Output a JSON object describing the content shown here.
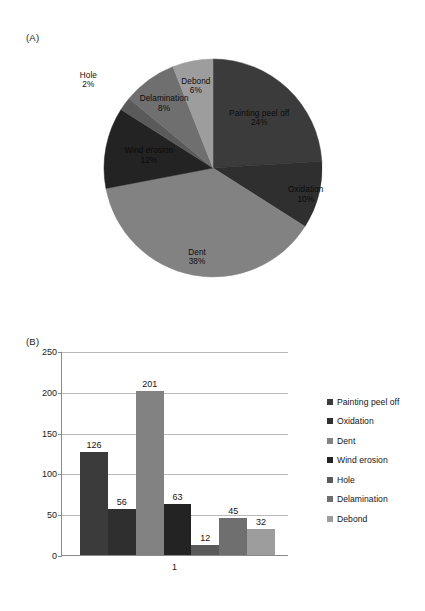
{
  "figure": {
    "panel_a_tag": "(A)",
    "panel_b_tag": "(B)"
  },
  "chart_data": [
    {
      "type": "pie",
      "title": "",
      "panel": "(A)",
      "legend_position": "none",
      "labels_show_percent": true,
      "start_angle_deg": 0,
      "direction": "clockwise",
      "slices": [
        {
          "label": "Painting peel off",
          "percent": 24,
          "percent_text": "24%",
          "color": "#3b3b3b"
        },
        {
          "label": "Oxidation",
          "percent": 10,
          "percent_text": "10%",
          "color": "#2f2f2f"
        },
        {
          "label": "Dent",
          "percent": 38,
          "percent_text": "38%",
          "color": "#828282"
        },
        {
          "label": "Wind erosion",
          "percent": 12,
          "percent_text": "12%",
          "color": "#232323"
        },
        {
          "label": "Hole",
          "percent": 2,
          "percent_text": "2%",
          "color": "#5a5a5a"
        },
        {
          "label": "Delamination",
          "percent": 8,
          "percent_text": "8%",
          "color": "#6f6f6f"
        },
        {
          "label": "Debond",
          "percent": 6,
          "percent_text": "6%",
          "color": "#9d9d9d"
        }
      ]
    },
    {
      "type": "bar",
      "panel": "(B)",
      "title": "",
      "xlabel": "",
      "ylabel": "",
      "categories": [
        "1"
      ],
      "category_tick_text": "1",
      "ylim": [
        0,
        250
      ],
      "yticks": [
        250,
        200,
        150,
        100,
        50,
        0
      ],
      "ytick_labels": [
        "250",
        "200",
        "150",
        "100",
        "50",
        "0"
      ],
      "grid": true,
      "grid_axis": "y",
      "legend_position": "right",
      "series": [
        {
          "name": "Painting peel off",
          "value": 126,
          "value_text": "126",
          "color": "#3b3b3b"
        },
        {
          "name": "Oxidation",
          "value": 56,
          "value_text": "56",
          "color": "#2f2f2f"
        },
        {
          "name": "Dent",
          "value": 201,
          "value_text": "201",
          "color": "#828282"
        },
        {
          "name": "Wind erosion",
          "value": 63,
          "value_text": "63",
          "color": "#232323"
        },
        {
          "name": "Hole",
          "value": 12,
          "value_text": "12",
          "color": "#5a5a5a"
        },
        {
          "name": "Delamination",
          "value": 45,
          "value_text": "45",
          "color": "#6f6f6f"
        },
        {
          "name": "Debond",
          "value": 32,
          "value_text": "32",
          "color": "#9d9d9d"
        }
      ]
    }
  ]
}
